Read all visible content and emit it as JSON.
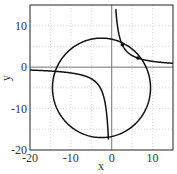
{
  "chart_data": {
    "type": "line",
    "title": "",
    "xlabel": "x",
    "ylabel": "y",
    "xlim": [
      -20,
      15
    ],
    "ylim": [
      -20,
      15
    ],
    "xticks": [
      -20,
      -10,
      0,
      10
    ],
    "yticks": [
      -20,
      -10,
      0,
      10
    ],
    "grid": true,
    "series": [
      {
        "name": "circle",
        "center": [
          -2.5,
          -5
        ],
        "radius": 12
      },
      {
        "name": "hyperbola",
        "equation": "x*y = 14 (shifted branches)",
        "asymptotes": {
          "x": 0,
          "y": 0
        }
      },
      {
        "name": "intersections",
        "points": [
          [
            2.6,
            5.4
          ],
          [
            6.4,
            2.2
          ]
        ]
      }
    ]
  },
  "labels": {
    "x": "x",
    "y": "y",
    "xticks": [
      "-20",
      "-10",
      "0",
      "10"
    ],
    "yticks": [
      "-20",
      "-10",
      "0",
      "10"
    ]
  }
}
